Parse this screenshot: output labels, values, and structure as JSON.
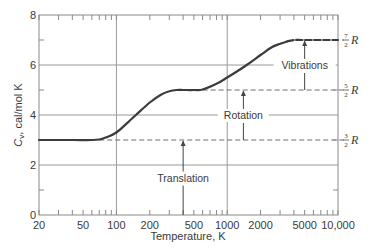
{
  "chart_data": {
    "type": "line",
    "title": "",
    "xlabel": "Temperature, K",
    "ylabel": "C_v, cal/mol K",
    "ylabel_main": "C",
    "ylabel_sub": "v",
    "ylabel_rest": ", cal/mol K",
    "xscale": "log",
    "xlim": [
      20,
      10000
    ],
    "ylim": [
      0,
      8
    ],
    "grid": true,
    "x_ticks": [
      20,
      50,
      100,
      200,
      500,
      1000,
      2000,
      5000,
      10000
    ],
    "x_tick_labels": [
      "20",
      "50",
      "100",
      "200",
      "500",
      "1000",
      "2000",
      "5000",
      "10,000"
    ],
    "y_ticks": [
      0,
      2,
      4,
      6,
      8
    ],
    "y_tick_labels": [
      "0",
      "2",
      "4",
      "6",
      "8"
    ],
    "x_gridlines": [
      100,
      1000
    ],
    "y_gridlines": [
      2,
      4,
      6
    ],
    "series": [
      {
        "name": "C_v (diatomic gas)",
        "style": "solid",
        "x": [
          20,
          40,
          60,
          70,
          80,
          100,
          130,
          150,
          200,
          250,
          300,
          350,
          400,
          500,
          600,
          800,
          1000,
          1500,
          2000,
          2500,
          3000,
          3500
        ],
        "values": [
          3.0,
          3.0,
          3.0,
          3.02,
          3.1,
          3.3,
          3.75,
          4.0,
          4.5,
          4.8,
          4.95,
          5.0,
          5.0,
          5.0,
          5.02,
          5.25,
          5.5,
          6.0,
          6.4,
          6.7,
          6.85,
          6.95
        ]
      },
      {
        "name": "C_v extrapolated",
        "style": "dashed",
        "x": [
          3500,
          4000,
          5000,
          10000
        ],
        "values": [
          6.95,
          7.0,
          7.0,
          7.0
        ]
      }
    ],
    "reference_lines": [
      {
        "label_num": "3",
        "label_den": "2",
        "label_sym": "R",
        "value": 3.0,
        "x_from": 70,
        "style": "dashed"
      },
      {
        "label_num": "5",
        "label_den": "2",
        "label_sym": "R",
        "value": 5.0,
        "x_from": 600,
        "style": "dashed"
      },
      {
        "label_num": "7",
        "label_den": "2",
        "label_sym": "R",
        "value": 7.0,
        "x_from": 4000,
        "style": "dashed"
      }
    ],
    "annotations": [
      {
        "text": "Translation",
        "arrow_x": 400,
        "from": 0,
        "to": 3.0
      },
      {
        "text": "Rotation",
        "arrow_x": 1400,
        "from": 3.0,
        "to": 5.0
      },
      {
        "text": "Vibrations",
        "arrow_x": 5000,
        "from": 5.0,
        "to": 7.0
      }
    ]
  }
}
